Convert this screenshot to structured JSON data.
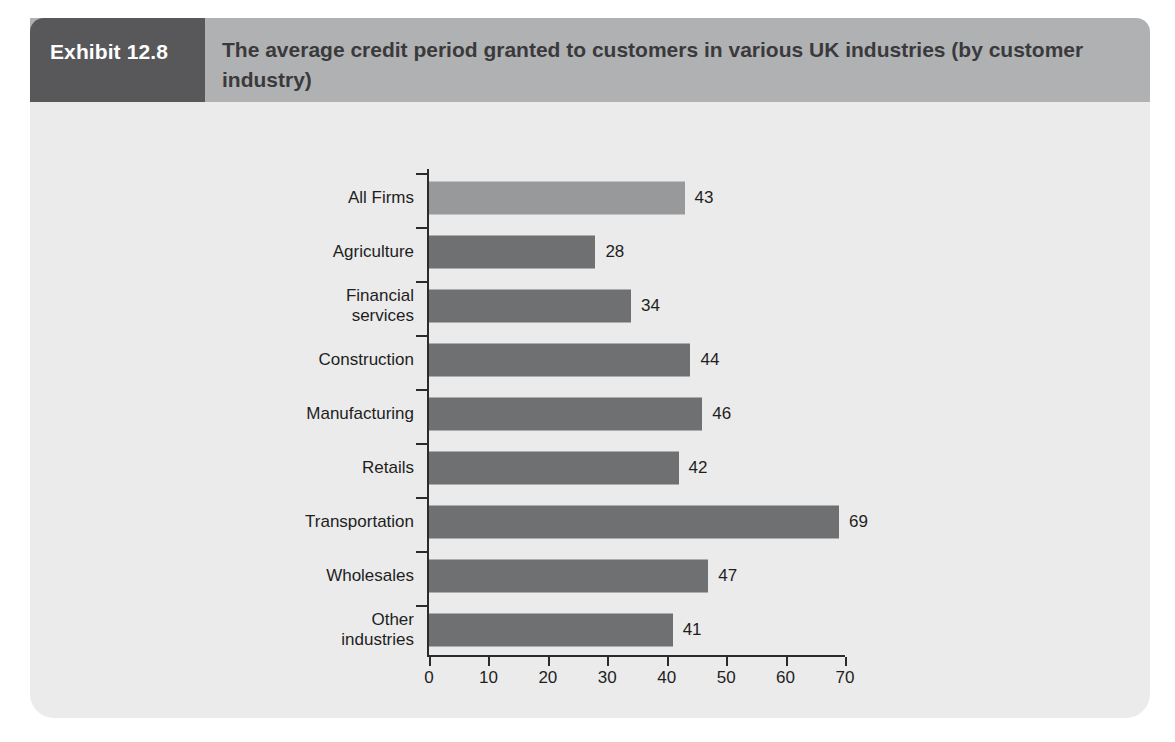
{
  "exhibit": {
    "number_label": "Exhibit 12.8",
    "title": "The average credit period granted to customers in various UK industries (by customer industry)"
  },
  "colors": {
    "header_number_bg": "#58585a",
    "header_band_bg": "#b0b1b3",
    "panel_bg": "#ebebeb",
    "bar_dark": "#6f7072",
    "bar_light": "#98999b",
    "axis": "#2b2b2b",
    "text": "#1e1e1e"
  },
  "chart_data": {
    "type": "bar",
    "orientation": "horizontal",
    "title": "The average credit period granted to customers in various UK industries (by customer industry)",
    "xlabel": "",
    "ylabel": "",
    "xlim": [
      0,
      70
    ],
    "xticks": [
      0,
      10,
      20,
      30,
      40,
      50,
      60,
      70
    ],
    "xtick_labels": [
      "0",
      "10",
      "20",
      "30",
      "40",
      "50",
      "60",
      "70"
    ],
    "grid": false,
    "legend": false,
    "categories": [
      "All Firms",
      "Agriculture",
      "Financial\nservices",
      "Construction",
      "Manufacturing",
      "Retails",
      "Transportation",
      "Wholesales",
      "Other\nindustries"
    ],
    "values": [
      43,
      28,
      34,
      44,
      46,
      42,
      69,
      47,
      41
    ],
    "value_labels": [
      "43",
      "28",
      "34",
      "44",
      "46",
      "42",
      "69",
      "47",
      "41"
    ],
    "bar_colors": [
      "#98999b",
      "#6f7072",
      "#6f7072",
      "#6f7072",
      "#6f7072",
      "#6f7072",
      "#6f7072",
      "#6f7072",
      "#6f7072"
    ]
  }
}
